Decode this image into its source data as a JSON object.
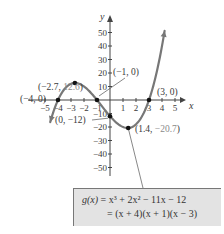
{
  "chart_data": {
    "type": "line",
    "title": "",
    "function_label": "g(x)",
    "equation_expanded": "g(x) = x³ + 2x² − 11x − 12",
    "equation_factored": "= (x + 4)(x + 1)(x − 3)",
    "xlabel": "x",
    "ylabel": "y",
    "xlim": [
      -5.5,
      5.5
    ],
    "ylim": [
      -55,
      55
    ],
    "x_ticks": [
      -5,
      -4,
      -3,
      -2,
      -1,
      1,
      2,
      3,
      4,
      5
    ],
    "y_ticks": [
      -50,
      -40,
      -30,
      -20,
      -10,
      10,
      20,
      30,
      40,
      50
    ],
    "x_tick_labels": [
      "−5",
      "−4",
      "−3",
      "−2",
      "−1",
      "1",
      "2",
      "3",
      "4",
      "5"
    ],
    "y_tick_labels": [
      "−50",
      "−40",
      "−30",
      "−20",
      "−10",
      "10",
      "20",
      "30",
      "40",
      "50"
    ],
    "grid": false,
    "curve_color": "#777777",
    "series": [
      {
        "name": "g(x) = x^3 + 2x^2 - 11x - 12",
        "x": [
          -4.6,
          -4.5,
          -4.25,
          -4.0,
          -3.5,
          -3.0,
          -2.7,
          -2.5,
          -2.0,
          -1.5,
          -1.0,
          -0.5,
          0.0,
          0.5,
          1.0,
          1.4,
          2.0,
          2.5,
          3.0,
          3.5,
          4.0,
          4.2
        ],
        "values": [
          -22.0,
          -18.4,
          -8.4,
          0.0,
          10.1,
          12.0,
          12.6,
          12.4,
          10.0,
          5.6,
          0.0,
          -5.9,
          -12.0,
          -17.4,
          -20.0,
          -20.7,
          -18.0,
          -11.9,
          0.0,
          15.6,
          40.0,
          54.0
        ]
      }
    ],
    "annotations": [
      {
        "label": "(−2.7, 12.6)",
        "x": -2.7,
        "y": 12.6,
        "type": "local maximum"
      },
      {
        "label": "(−4, 0)",
        "x": -4,
        "y": 0,
        "type": "x-intercept"
      },
      {
        "label": "(−1, 0)",
        "x": -1,
        "y": 0,
        "type": "x-intercept"
      },
      {
        "label": "(3, 0)",
        "x": 3,
        "y": 0,
        "type": "x-intercept"
      },
      {
        "label": "(0, −12)",
        "x": 0,
        "y": -12,
        "type": "y-intercept"
      },
      {
        "label": "(1.4, −20.7)",
        "x": 1.4,
        "y": -20.7,
        "type": "local minimum"
      }
    ]
  },
  "labels": {
    "max_x": "(−2.7, ",
    "max_y": "12.6",
    "max_close": ")",
    "root1": "(−4, 0)",
    "root2": "(−1, 0)",
    "root3": "(3, 0)",
    "yint": "(0, −12)",
    "min_x": "(1.4, ",
    "min_y": "−20.7",
    "min_close": ")"
  },
  "equation": {
    "line1_lhs": "g(x)",
    "line1_rhs": " = x³ + 2x² − 11x − 12",
    "line2": "= (x + 4)(x + 1)(x − 3)"
  }
}
